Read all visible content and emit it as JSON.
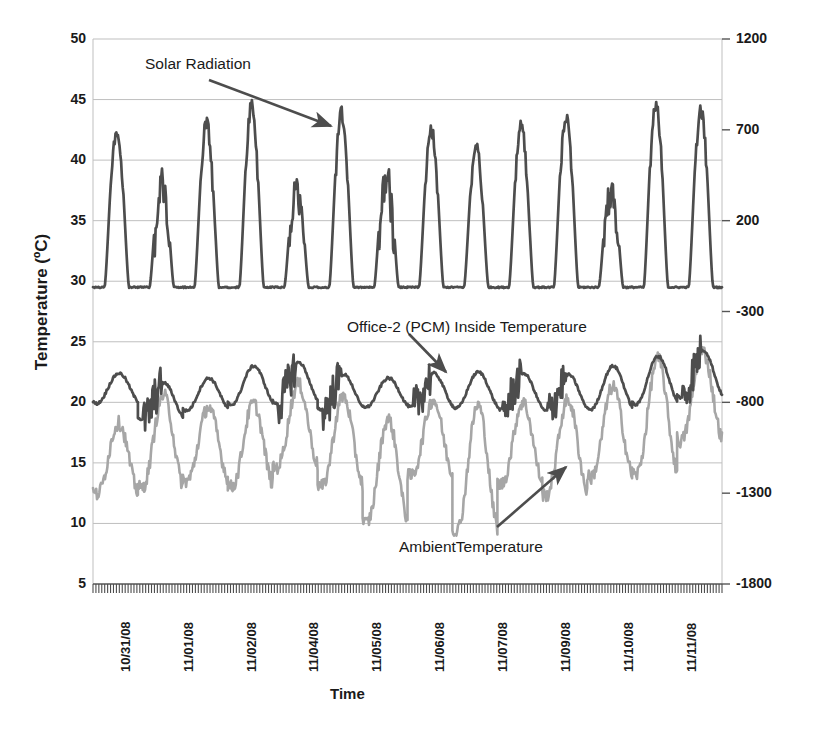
{
  "chart_data": {
    "type": "line",
    "title": "",
    "xlabel": "Time",
    "ylabel": "Temperature (ºC)",
    "y2label": "Solar Radiation (W /sqr meter)",
    "ylim": [
      5,
      50
    ],
    "y2lim": [
      -1800,
      1200
    ],
    "yticks": [
      "50",
      "45",
      "40",
      "35",
      "30",
      "25",
      "20",
      "15",
      "10",
      "5"
    ],
    "ytick_values": [
      50,
      45,
      40,
      35,
      30,
      25,
      20,
      15,
      10,
      5
    ],
    "y2ticks": [
      "1200",
      "700",
      "200",
      "-300",
      "-800",
      "-1300",
      "-1800"
    ],
    "y2tick_values": [
      1200,
      700,
      200,
      -300,
      -800,
      -1300,
      -1800
    ],
    "xticks": [
      "10/31/08",
      "11/01/08",
      "11/02/08",
      "11/04/08",
      "11/05/08",
      "11/06/08",
      "11/07/08",
      "11/09/08",
      "11/10/08",
      "11/11/08"
    ],
    "grid": "horizontal",
    "legend": "annotations",
    "annotations": [
      {
        "name": "solar-radiation",
        "text": "Solar Radiation",
        "x": 145,
        "y": 55
      },
      {
        "name": "office-2-inside-temperature",
        "text": "Office-2 (PCM) Inside Temperature",
        "x": 347,
        "y": 318
      },
      {
        "name": "ambient-temperature",
        "text": "AmbientTemperature",
        "x": 399,
        "y": 538
      }
    ],
    "colors": {
      "solar_radiation": "#4d4d4d",
      "inside_temperature": "#4d4d4d",
      "ambient_temperature": "#a6a6a6",
      "gridline": "#bfbfbf",
      "axis": "#808080",
      "text": "#1a1a1a"
    },
    "series": [
      {
        "name": "Solar Radiation",
        "axis": "secondary",
        "units": "W /sqr meter",
        "note": "Daily bell-shaped peaks, night baseline near -1530 W/sqr meter (plotted equivalent 29.5 on temperature scale); peaks reach approx 1080-1230 W/sqr meter on clear days and 500-850 on cloudy days.",
        "peaks_plot_equivalent": [
          43.2,
          39.5,
          43.7,
          45.0,
          39.0,
          44.6,
          40.1,
          43.2,
          41.7,
          43.5,
          44.4,
          38.7,
          45.5,
          44.9
        ],
        "baseline_plot_equivalent": 29.5
      },
      {
        "name": "Office-2 (PCM) Inside Temperature",
        "axis": "primary",
        "units": "ºC",
        "range": [
          18.3,
          24.3
        ],
        "note": "Smooth diurnal oscillation with high-frequency spikes; daily minima near 18.5-19.5, maxima near 22-24.3"
      },
      {
        "name": "AmbientTemperature",
        "axis": "primary",
        "units": "ºC",
        "range": [
          9.2,
          24.2
        ],
        "note": "Large diurnal swing; daily minima near 9.2-14, maxima near 17-24.2"
      }
    ]
  },
  "plot_geometry": {
    "left": 93,
    "right": 722,
    "top": 39,
    "bottom": 584
  }
}
